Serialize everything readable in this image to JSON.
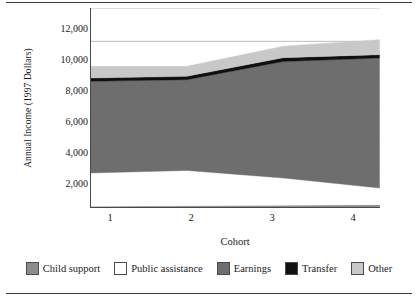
{
  "chart_data": {
    "type": "area",
    "title": "",
    "subtitle": "",
    "xlabel": "Cohort",
    "ylabel": "Annual Income (1997 Dollars)",
    "categories": [
      "1",
      "2",
      "3",
      "4"
    ],
    "x": [
      1,
      2,
      3,
      4
    ],
    "xtick_labels": [
      "1",
      "2",
      "3",
      "4"
    ],
    "ytick_labels": [
      "12,000",
      "10,000",
      "8,000",
      "6,000",
      "4,000",
      "2,000"
    ],
    "ytick_values": [
      12000,
      10000,
      8000,
      6000,
      4000,
      2000
    ],
    "ylim": [
      0,
      12000
    ],
    "xlim": [
      1,
      4
    ],
    "grid": "horizontal",
    "stacked": true,
    "legend_position": "bottom",
    "legend_entries": [
      "Child support",
      "Public assistance",
      "Earnings",
      "Transfer",
      "Other"
    ],
    "series": [
      {
        "name": "Child support",
        "color": "#8c8c8c",
        "values": [
          100,
          130,
          160,
          200
        ]
      },
      {
        "name": "Public assistance",
        "color": "#ffffff",
        "values": [
          2000,
          2120,
          1640,
          1000
        ]
      },
      {
        "name": "Earnings",
        "color": "#6e6e6e",
        "values": [
          5500,
          5450,
          6990,
          7800
        ]
      },
      {
        "name": "Transfer",
        "color": "#101010",
        "values": [
          200,
          200,
          230,
          200
        ]
      },
      {
        "name": "Other",
        "color": "#c8c8c8",
        "values": [
          700,
          600,
          690,
          900
        ]
      }
    ],
    "cumulative_tops": {
      "child_support": [
        100,
        130,
        160,
        200
      ],
      "public_assistance": [
        2100,
        2250,
        1800,
        1200
      ],
      "earnings": [
        7600,
        7700,
        8790,
        9000
      ],
      "transfer": [
        7800,
        7900,
        9020,
        9200
      ],
      "other": [
        8500,
        8500,
        9710,
        10100
      ]
    }
  },
  "colors": {
    "axis": "#4a4a4a",
    "grid": "#bdbdbd",
    "text": "#1a1a1a",
    "frame_rule": "#3a3a3a",
    "child_support": "#8c8c8c",
    "public_assistance": "#ffffff",
    "earnings": "#6e6e6e",
    "transfer": "#101010",
    "other": "#c8c8c8"
  },
  "axis": {
    "ylabel": "Annual Income (1997 Dollars)",
    "xlabel": "Cohort"
  },
  "legend": {
    "items": [
      {
        "label": "Child support",
        "swatch": "#8c8c8c"
      },
      {
        "label": "Public assistance",
        "swatch": "#ffffff"
      },
      {
        "label": "Earnings",
        "swatch": "#6e6e6e"
      },
      {
        "label": "Transfer",
        "swatch": "#101010"
      },
      {
        "label": "Other",
        "swatch": "#c8c8c8"
      }
    ]
  }
}
